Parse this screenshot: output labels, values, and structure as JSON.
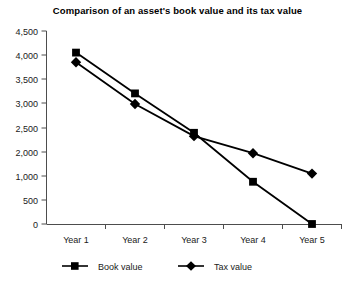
{
  "chart_data": {
    "type": "line",
    "title": "Comparison of an asset's book value and its tax value",
    "xlabel": "",
    "ylabel": "",
    "categories": [
      "Year 1",
      "Year 2",
      "Year 3",
      "Year 4",
      "Year 5"
    ],
    "series": [
      {
        "name": "Book value",
        "marker": "square",
        "color": "#000000",
        "values": [
          4050,
          3200,
          2400,
          880,
          0
        ]
      },
      {
        "name": "Tax value",
        "marker": "diamond",
        "color": "#000000",
        "values": [
          3850,
          2980,
          2330,
          1950,
          1100
        ]
      }
    ],
    "y_tick_labels": [
      "4,500",
      "4,000",
      "3,500",
      "3,000",
      "2,500",
      "2,000",
      "1,000",
      "500",
      "0"
    ],
    "y_tick_values": [
      4500,
      4000,
      3500,
      3000,
      2500,
      2000,
      1000,
      500,
      0
    ],
    "ylim": [
      0,
      4500
    ],
    "grid": false,
    "legend_position": "bottom"
  },
  "legend": {
    "entries": [
      {
        "label": "Book value",
        "marker": "square"
      },
      {
        "label": "Tax value",
        "marker": "diamond"
      }
    ]
  },
  "axes": {
    "x_labels": [
      "Year 1",
      "Year 2",
      "Year 3",
      "Year 4",
      "Year 5"
    ],
    "y_labels": [
      "4,500",
      "4,000",
      "3,500",
      "3,000",
      "2,500",
      "2,000",
      "1,000",
      "500",
      "0"
    ]
  }
}
